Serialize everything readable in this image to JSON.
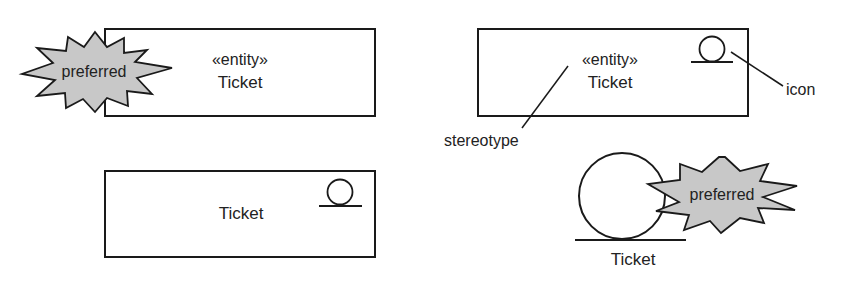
{
  "diagram": {
    "type": "uml-stereotype-notation-examples",
    "colors": {
      "stroke": "#1a1a1a",
      "text": "#222222",
      "burst_fill": "#c8c8c8",
      "background": "#ffffff"
    },
    "panels": [
      {
        "id": "top-left",
        "box": {
          "x": 105,
          "y": 29,
          "w": 270,
          "h": 87
        },
        "stereotype": "«entity»",
        "name": "Ticket",
        "burst_label": "preferred"
      },
      {
        "id": "top-right",
        "box": {
          "x": 478,
          "y": 29,
          "w": 270,
          "h": 87
        },
        "stereotype": "«entity»",
        "name": "Ticket",
        "icon": "entity-icon",
        "callouts": [
          {
            "label": "icon"
          },
          {
            "label": "stereotype"
          }
        ]
      },
      {
        "id": "bottom-left",
        "box": {
          "x": 105,
          "y": 171,
          "w": 270,
          "h": 86
        },
        "name": "Ticket",
        "icon": "entity-icon"
      },
      {
        "id": "bottom-right",
        "icon": "entity-icon-large",
        "name": "Ticket",
        "burst_label": "preferred"
      }
    ]
  }
}
